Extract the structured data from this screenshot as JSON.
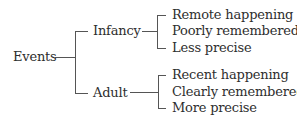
{
  "diagram": {
    "type": "tree",
    "root": {
      "label": "Events"
    },
    "branches": [
      {
        "label": "Infancy",
        "leaves": [
          "Remote happening",
          "Poorly remembered",
          "Less precise"
        ]
      },
      {
        "label": "Adult",
        "leaves": [
          "Recent happening",
          "Clearly remembered",
          "More precise"
        ]
      }
    ],
    "line_color": "#555555",
    "text_color": "#2e2e2e"
  }
}
